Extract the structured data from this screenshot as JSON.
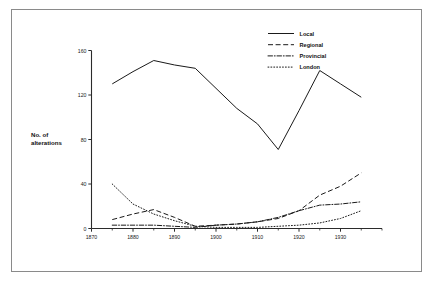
{
  "chart_data": {
    "type": "line",
    "title": "",
    "xlabel": "",
    "ylabel": "No. of alterations",
    "xlim": [
      1870,
      1940
    ],
    "ylim": [
      0,
      160
    ],
    "grid": false,
    "legend_position": "top-right",
    "x": [
      1875,
      1880,
      1885,
      1890,
      1895,
      1900,
      1905,
      1910,
      1915,
      1920,
      1925,
      1930,
      1935
    ],
    "x_ticks_major": [
      1870,
      1880,
      1890,
      1900,
      1910,
      1920,
      1930
    ],
    "x_tick_labels": [
      "1870",
      "1880",
      "1890",
      "1900",
      "1910",
      "1920",
      "1930"
    ],
    "x_ticks_minor": [
      1875,
      1885,
      1895,
      1905,
      1915,
      1925,
      1935,
      1940
    ],
    "y_ticks": [
      0,
      40,
      80,
      120,
      160
    ],
    "y_tick_labels": [
      "0",
      "40",
      "80",
      "120",
      "160"
    ],
    "series": [
      {
        "name": "Local",
        "style": "solid",
        "values": [
          130,
          141,
          151,
          147,
          144,
          126,
          108,
          94,
          71,
          106,
          142,
          130,
          118
        ]
      },
      {
        "name": "Regional",
        "style": "dashed",
        "values": [
          8,
          13,
          17,
          10,
          2,
          3,
          4,
          6,
          9,
          16,
          30,
          38,
          50
        ]
      },
      {
        "name": "Provincial",
        "style": "dash-dot",
        "values": [
          3,
          3,
          3,
          2,
          1,
          3,
          4,
          6,
          10,
          16,
          21,
          22,
          24
        ]
      },
      {
        "name": "London",
        "style": "dotted",
        "values": [
          40,
          22,
          13,
          7,
          2,
          1,
          1,
          1,
          2,
          3,
          5,
          9,
          16
        ]
      }
    ]
  },
  "legend": {
    "items": [
      {
        "label": "Local",
        "style": "solid"
      },
      {
        "label": "Regional",
        "style": "dashed"
      },
      {
        "label": "Provincial",
        "style": "dash-dot"
      },
      {
        "label": "London",
        "style": "dotted"
      }
    ]
  },
  "axes": {
    "y_title_line1": "No. of",
    "y_title_line2": "alterations"
  }
}
